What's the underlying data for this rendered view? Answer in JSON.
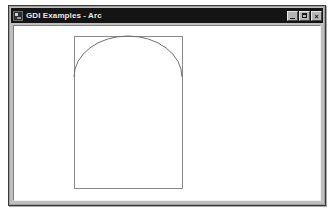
{
  "window": {
    "title": "GDI Examples - Arc",
    "icon": "app-window-icon",
    "controls": {
      "minimize_label": "_",
      "maximize_label": "□",
      "close_label": "×"
    }
  },
  "canvas": {
    "name": "gdi-drawing-surface",
    "background_color": "#ffffff",
    "shapes": [
      {
        "type": "rectangle",
        "name": "bounding-rectangle",
        "x": 60,
        "y": 10,
        "width": 108,
        "height": 152,
        "stroke_color": "#8a8a8a"
      },
      {
        "type": "arc",
        "name": "arc-curve",
        "center_x": 114,
        "center_y": 51,
        "radius_x": 54,
        "radius_y": 41,
        "start_x": 60,
        "start_y": 51,
        "end_x": 168,
        "end_y": 51,
        "sweep": "upper-half",
        "stroke_color": "#6e6e6e"
      }
    ]
  },
  "colors": {
    "title_bar": "#141414",
    "title_text": "#e8e8e8",
    "window_face": "#bfbfbf",
    "window_border": "#3a3a3a",
    "client_background": "#ffffff",
    "shape_stroke": "#8a8a8a",
    "desktop": "#ffffff"
  }
}
